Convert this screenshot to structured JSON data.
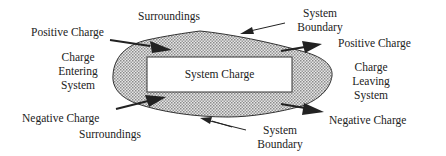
{
  "diagram": {
    "system_label": "System Charge",
    "left_group": {
      "positive": "Positive Charge",
      "title_lines": [
        "Charge",
        "Entering",
        "System"
      ],
      "negative": "Negative Charge"
    },
    "right_group": {
      "positive": "Positive Charge",
      "title_lines": [
        "Charge",
        "Leaving",
        "System"
      ],
      "negative": "Negative Charge"
    },
    "surroundings_top": "Surroundings",
    "surroundings_bottom": "Surroundings",
    "boundary_top_lines": [
      "System",
      "Boundary"
    ],
    "boundary_bottom_lines": [
      "System",
      "Boundary"
    ],
    "colors": {
      "fill_pattern": "#bdbdbd",
      "outline": "#333333",
      "arrow": "#222222",
      "text": "#222222"
    }
  }
}
